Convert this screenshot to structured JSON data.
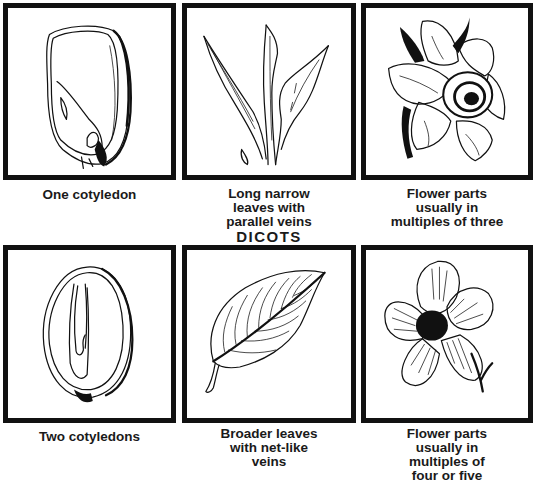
{
  "heading": "DICOTS",
  "panels": [
    {
      "id": "one-cotyledon",
      "caption": "One cotyledon",
      "drawing": "monocot-seed-icon"
    },
    {
      "id": "parallel-veins",
      "caption": "Long narrow leaves with parallel veins",
      "drawing": "monocot-leaves-icon"
    },
    {
      "id": "flower-three",
      "caption": "Flower parts usually in multiples of three",
      "drawing": "daffodil-flower-icon"
    },
    {
      "id": "two-cotyledons",
      "caption": "Two cotyledons",
      "drawing": "dicot-seed-icon"
    },
    {
      "id": "net-veins",
      "caption": "Broader leaves with net-like veins",
      "drawing": "dicot-leaf-icon"
    },
    {
      "id": "flower-four-five",
      "caption": "Flower parts usually in multiples of four or five",
      "drawing": "five-petal-flower-icon"
    }
  ],
  "caption_lines": {
    "p0": [
      "One cotyledon"
    ],
    "p1": [
      "Long narrow",
      "leaves with",
      "parallel veins"
    ],
    "p2": [
      "Flower parts",
      "usually in",
      "multiples of three"
    ],
    "p3": [
      "Two cotyledons"
    ],
    "p4": [
      "Broader leaves",
      "with net-like",
      "veins"
    ],
    "p5": [
      "Flower parts",
      "usually in",
      "multiples of",
      "four or five"
    ]
  }
}
